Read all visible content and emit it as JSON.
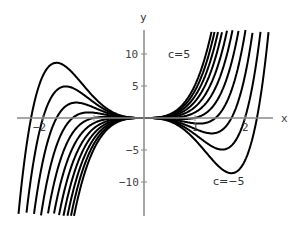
{
  "chart_data": {
    "type": "line",
    "title": "",
    "xlabel": "x",
    "ylabel": "y",
    "xlim": [
      -2.5,
      2.55
    ],
    "ylim": [
      -15,
      13.5
    ],
    "x_ticks": [
      -2,
      -1,
      1,
      2
    ],
    "x_tick_labels": [
      "-2",
      "1",
      "2"
    ],
    "y_ticks": [
      10,
      5,
      -5,
      -10
    ],
    "y_tick_labels": [
      "10",
      "5",
      "-5",
      "-10"
    ],
    "grid": false,
    "legend": "none",
    "formula": "y = 0.83*(x^5 + c*x^3)",
    "series_parameter": "c",
    "series": [
      {
        "name": "c=-5",
        "c": -5
      },
      {
        "name": "c=-4",
        "c": -4
      },
      {
        "name": "c=-3",
        "c": -3
      },
      {
        "name": "c=-2",
        "c": -2
      },
      {
        "name": "c=-1",
        "c": -1
      },
      {
        "name": "c=0",
        "c": 0
      },
      {
        "name": "c=1",
        "c": 1
      },
      {
        "name": "c=2",
        "c": 2
      },
      {
        "name": "c=3",
        "c": 3
      },
      {
        "name": "c=4",
        "c": 4
      },
      {
        "name": "c=5",
        "c": 5
      }
    ],
    "annotations": [
      {
        "text": "c=5",
        "x": 1.05,
        "y": 8.3
      },
      {
        "text": "c=-5",
        "x": 1.45,
        "y": -11.2
      }
    ]
  },
  "labels": {
    "x_axis": "x",
    "y_axis": "y",
    "c_top": "c=5",
    "c_bottom": "c=−5",
    "tick_x_neg2": "−2",
    "tick_x_1": "1",
    "tick_x_2": "2",
    "tick_y_10": "10",
    "tick_y_5": "5",
    "tick_y_neg5": "−5",
    "tick_y_neg10": "−10"
  }
}
